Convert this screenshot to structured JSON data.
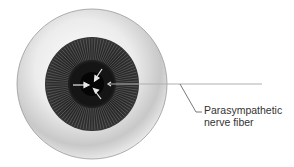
{
  "diagram": {
    "labels": [
      {
        "line1": "Parasympathetic",
        "line2": "nerve fiber"
      }
    ],
    "colors": {
      "sclera": "#d9d9d9",
      "iris": "#2a2a2a",
      "pupil": "#0a0a0a",
      "nerve_line": "#aaaaaa",
      "text": "#333333"
    }
  }
}
